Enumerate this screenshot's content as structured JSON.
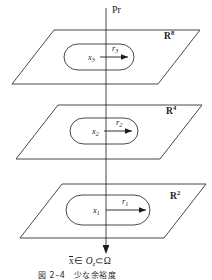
{
  "figure": {
    "type": "diagram",
    "projection_label": "Pr",
    "planes": [
      {
        "id": "plane-top",
        "space": "R",
        "exponent": "8",
        "point": "x",
        "point_sub": "3",
        "radius": "r",
        "radius_sub": "3"
      },
      {
        "id": "plane-middle",
        "space": "R",
        "exponent": "4",
        "point": "x",
        "point_sub": "2",
        "radius": "r",
        "radius_sub": "2"
      },
      {
        "id": "plane-bottom",
        "space": "R",
        "exponent": "2",
        "point": "x",
        "point_sub": "1",
        "radius": "r",
        "radius_sub": "1"
      }
    ],
    "bottom_expression": {
      "var": "x",
      "in_symbol": "∈",
      "set": "O",
      "set_sub": "z",
      "subset_symbol": "⊂",
      "domain": "Ω"
    },
    "caption": "図 2–4　少な余裕度",
    "colors": {
      "stroke": "#1b1b1b",
      "text": "#1b1b1b",
      "background": "#ffffff"
    }
  }
}
